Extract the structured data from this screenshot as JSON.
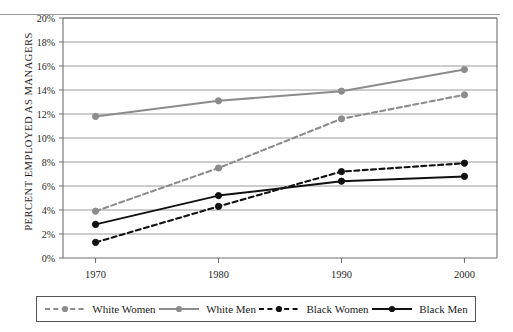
{
  "chart_data": {
    "type": "line",
    "title": "",
    "xlabel": "",
    "ylabel": "PERCENT EMPLOYED AS MANAGERS",
    "x": [
      1970,
      1980,
      1990,
      2000
    ],
    "categories": [
      "1970",
      "1980",
      "1990",
      "2000"
    ],
    "xtick_labels": [
      "1970",
      "1980",
      "1990",
      "2000"
    ],
    "ytick_labels": [
      "0%",
      "2%",
      "4%",
      "6%",
      "8%",
      "10%",
      "12%",
      "14%",
      "16%",
      "18%",
      "20%"
    ],
    "ytick_values": [
      0,
      2,
      4,
      6,
      8,
      10,
      12,
      14,
      16,
      18,
      20
    ],
    "ylim": [
      0,
      20
    ],
    "ytick_step": 2,
    "grid": "horizontal",
    "legend_position": "bottom",
    "series": [
      {
        "name": "White Women",
        "values": [
          3.9,
          7.5,
          11.6,
          13.6
        ],
        "color": "#8c8c8c",
        "style": "dashed",
        "marker": "circle"
      },
      {
        "name": "White Men",
        "values": [
          11.8,
          13.1,
          13.9,
          15.7
        ],
        "color": "#8c8c8c",
        "style": "solid",
        "marker": "circle"
      },
      {
        "name": "Black Women",
        "values": [
          1.3,
          4.3,
          7.2,
          7.9
        ],
        "color": "#111111",
        "style": "dashed",
        "marker": "circle"
      },
      {
        "name": "Black Men",
        "values": [
          2.8,
          5.2,
          6.4,
          6.8
        ],
        "color": "#111111",
        "style": "solid",
        "marker": "circle"
      }
    ]
  },
  "legend": {
    "items": [
      {
        "label": "White Women"
      },
      {
        "label": "White Men"
      },
      {
        "label": "Black Women"
      },
      {
        "label": "Black Men"
      }
    ]
  },
  "colors": {
    "gray_series": "#8c8c8c",
    "black_series": "#111111",
    "gridline": "#8e8e8e",
    "axis": "#6e6e6e",
    "text": "#1f1f1f",
    "background": "#ffffff"
  }
}
